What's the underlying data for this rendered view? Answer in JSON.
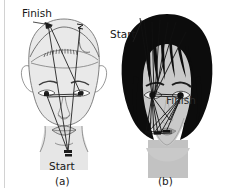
{
  "figure": {
    "type": "scanpath-overlay-figure",
    "background_color": "#ffffff",
    "divider_color": "#cfcfcf",
    "panels": [
      {
        "id": "a",
        "caption": "(a)",
        "subject": "line-drawing face (sketch / illustration)",
        "skin_color": "#e3e3e3",
        "outline_color": "#6b6b6b",
        "gaze_color": "#242424",
        "labels": [
          {
            "name": "finish",
            "text": "Finish",
            "x": 22,
            "y": 18
          },
          {
            "name": "start",
            "text": "Start",
            "x": 49,
            "y": 166
          }
        ]
      },
      {
        "id": "b",
        "caption": "(b)",
        "subject": "photograph-style face with black hair",
        "skin_color": "#c9c9c9",
        "hair_color": "#0b0b0b",
        "gaze_color": "#111111",
        "labels": [
          {
            "name": "start",
            "text": "Start",
            "x": 111,
            "y": 38
          },
          {
            "name": "finish",
            "text": "Finish",
            "x": 168,
            "y": 103
          }
        ]
      }
    ],
    "captions": {
      "panel_a": "(a)",
      "panel_b": "(b)"
    },
    "label_text": {
      "finish": "Finish",
      "start": "Start"
    }
  }
}
